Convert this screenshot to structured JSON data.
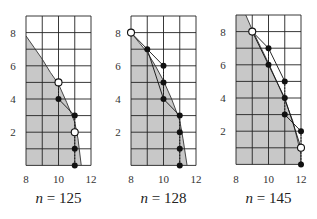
{
  "chart_data": [
    {
      "type": "scatter",
      "title": "",
      "caption": "n = 125",
      "caption_var": "n",
      "caption_value": "125",
      "xlabel": "",
      "ylabel": "",
      "xlim": [
        8,
        12
      ],
      "ylim": [
        0,
        9
      ],
      "xticks": [
        8,
        10,
        12
      ],
      "yticks": [
        2,
        4,
        6,
        8
      ],
      "grid": true,
      "shaded_region": {
        "boundary_curve": [
          [
            8,
            7.8
          ],
          [
            8.5,
            7.1
          ],
          [
            9,
            6.4
          ],
          [
            9.5,
            5.6
          ],
          [
            10,
            4.9
          ],
          [
            10.5,
            3.8
          ],
          [
            11,
            2.6
          ],
          [
            11.2,
            1.6
          ],
          [
            11.4,
            0
          ]
        ],
        "color": "#c8c8c8"
      },
      "open_points": [
        [
          10,
          5
        ],
        [
          11,
          2
        ]
      ],
      "filled_points": [
        [
          10,
          4
        ],
        [
          11,
          3
        ],
        [
          11,
          1
        ],
        [
          11,
          0
        ]
      ],
      "solid_lines": [
        [
          [
            10,
            4
          ],
          [
            11,
            3
          ]
        ]
      ],
      "dashed_lines": [
        [
          [
            10,
            5
          ],
          [
            10,
            4
          ]
        ],
        [
          [
            11,
            3
          ],
          [
            11,
            0
          ]
        ]
      ]
    },
    {
      "type": "scatter",
      "title": "",
      "caption": "n = 128",
      "caption_var": "n",
      "caption_value": "128",
      "xlabel": "",
      "ylabel": "",
      "xlim": [
        8,
        12
      ],
      "ylim": [
        0,
        9
      ],
      "xticks": [
        8,
        10,
        12
      ],
      "yticks": [
        2,
        4,
        6,
        8
      ],
      "grid": true,
      "shaded_region": {
        "boundary_curve": [
          [
            8,
            8
          ],
          [
            8.5,
            7.4
          ],
          [
            9,
            6.8
          ],
          [
            9.5,
            6.0
          ],
          [
            10,
            5.1
          ],
          [
            10.5,
            4.0
          ],
          [
            11,
            2.7
          ],
          [
            11.2,
            1.6
          ],
          [
            11.45,
            0
          ]
        ],
        "color": "#c8c8c8"
      },
      "open_points": [
        [
          8,
          8
        ]
      ],
      "filled_points": [
        [
          9,
          7
        ],
        [
          10,
          6
        ],
        [
          10,
          5
        ],
        [
          10,
          4
        ],
        [
          11,
          3
        ],
        [
          11,
          2
        ],
        [
          11,
          1
        ],
        [
          11,
          0
        ]
      ],
      "solid_lines": [
        [
          [
            8,
            8
          ],
          [
            9,
            7
          ]
        ],
        [
          [
            9,
            7
          ],
          [
            10,
            6
          ]
        ],
        [
          [
            9,
            7
          ],
          [
            10,
            4
          ]
        ],
        [
          [
            10,
            4
          ],
          [
            11,
            3
          ]
        ]
      ],
      "dashed_lines": [
        [
          [
            10,
            6
          ],
          [
            10,
            4
          ]
        ],
        [
          [
            11,
            3
          ],
          [
            11,
            0
          ]
        ]
      ]
    },
    {
      "type": "scatter",
      "title": "",
      "caption": "n = 145",
      "caption_var": "n",
      "caption_value": "145",
      "xlabel": "",
      "ylabel": "",
      "xlim": [
        8,
        12
      ],
      "ylim": [
        0,
        9
      ],
      "xticks": [
        8,
        10,
        12
      ],
      "yticks": [
        2,
        4,
        6,
        8
      ],
      "grid": true,
      "shaded_region": {
        "boundary_curve": [
          [
            8.6,
            9
          ],
          [
            9,
            8.1
          ],
          [
            9.5,
            7.1
          ],
          [
            10,
            6.1
          ],
          [
            10.5,
            5.0
          ],
          [
            11,
            3.9
          ],
          [
            11.5,
            2.6
          ],
          [
            12,
            0.6
          ],
          [
            12,
            0
          ]
        ],
        "color": "#c8c8c8"
      },
      "open_points": [
        [
          9,
          8
        ],
        [
          12,
          1
        ]
      ],
      "filled_points": [
        [
          10,
          7
        ],
        [
          10,
          6
        ],
        [
          11,
          5
        ],
        [
          11,
          4
        ],
        [
          11,
          3
        ],
        [
          12,
          2
        ],
        [
          12,
          0
        ]
      ],
      "solid_lines": [
        [
          [
            9,
            8
          ],
          [
            10,
            7
          ]
        ],
        [
          [
            9,
            8
          ],
          [
            10,
            6
          ]
        ],
        [
          [
            10,
            7
          ],
          [
            11,
            5
          ]
        ],
        [
          [
            10,
            6
          ],
          [
            11,
            4
          ]
        ],
        [
          [
            11,
            3
          ],
          [
            12,
            2
          ]
        ],
        [
          [
            11,
            4
          ],
          [
            12,
            1
          ]
        ]
      ],
      "dashed_lines": [
        [
          [
            10,
            7
          ],
          [
            10,
            6
          ]
        ],
        [
          [
            11,
            5
          ],
          [
            11,
            3
          ]
        ],
        [
          [
            12,
            2
          ],
          [
            12,
            0
          ]
        ]
      ]
    }
  ],
  "panels_layout": [
    {
      "x0": 26,
      "y_top": 16,
      "ux": 16.25,
      "uy": 16.6
    },
    {
      "x0": 131,
      "y_top": 16,
      "ux": 16.25,
      "uy": 16.6
    },
    {
      "x0": 236,
      "y_top": 15,
      "ux": 16.25,
      "uy": 16.6
    }
  ],
  "colors": {
    "shade": "#c8c8c8",
    "grid": "#222222",
    "point": "#111111",
    "open_fill": "#ffffff"
  }
}
